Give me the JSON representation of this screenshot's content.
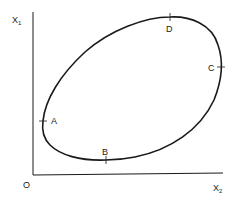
{
  "diagram": {
    "axes": {
      "y_label": "X",
      "y_label_sub": "1",
      "x_label": "X",
      "x_label_sub": "2",
      "origin_label": "O"
    },
    "curve": {
      "type": "closed-loop",
      "stroke_color": "#1a1a1a"
    },
    "points": [
      {
        "id": "A",
        "label": "A"
      },
      {
        "id": "B",
        "label": "B"
      },
      {
        "id": "C",
        "label": "C"
      },
      {
        "id": "D",
        "label": "D"
      }
    ]
  }
}
